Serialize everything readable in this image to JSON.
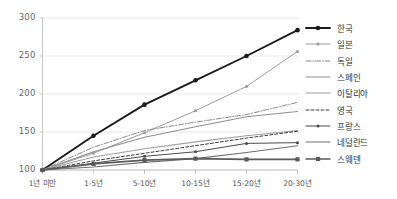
{
  "chart_data": {
    "type": "line",
    "title": "",
    "xlabel": "",
    "ylabel": "",
    "ylim": [
      100,
      300
    ],
    "yticks": [
      100,
      150,
      200,
      250,
      300
    ],
    "grid": true,
    "legend_position": "right",
    "categories": [
      "1년 미만",
      "1-5년",
      "5-10년",
      "10-15년",
      "15-20년",
      "20-30년"
    ],
    "series": [
      {
        "name": "한국",
        "values": [
          100,
          145,
          186,
          218,
          250,
          284
        ],
        "color": "#1a1a1a",
        "style": "solid",
        "width": 1.9,
        "marker": "circle"
      },
      {
        "name": "일본",
        "values": [
          100,
          122,
          149,
          178,
          210,
          256
        ],
        "color": "#9a9a9a",
        "style": "solid",
        "width": 1.0,
        "marker": "dot"
      },
      {
        "name": "독일",
        "values": [
          100,
          130,
          152,
          163,
          173,
          189
        ],
        "color": "#8a8a8a",
        "style": "dashdot",
        "width": 1.0,
        "marker": "none"
      },
      {
        "name": "스페인",
        "values": [
          100,
          124,
          143,
          157,
          170,
          177
        ],
        "color": "#8f8f8f",
        "style": "solid",
        "width": 1.1,
        "marker": "none"
      },
      {
        "name": "이탈리아",
        "values": [
          100,
          117,
          128,
          137,
          145,
          152
        ],
        "color": "#9e9e9e",
        "style": "solid",
        "width": 1.1,
        "marker": "none"
      },
      {
        "name": "영국",
        "values": [
          100,
          112,
          122,
          132,
          142,
          151
        ],
        "color": "#3d3d3d",
        "style": "dashed",
        "width": 1.0,
        "marker": "none"
      },
      {
        "name": "프랑스",
        "values": [
          100,
          109,
          118,
          124,
          135,
          136
        ],
        "color": "#4a4a4a",
        "style": "solid",
        "width": 1.0,
        "marker": "dot"
      },
      {
        "name": "네덜란드",
        "values": [
          100,
          104,
          110,
          115,
          123,
          132
        ],
        "color": "#707070",
        "style": "solid",
        "width": 1.1,
        "marker": "none"
      },
      {
        "name": "스웨덴",
        "values": [
          100,
          108,
          113,
          115,
          114,
          114
        ],
        "color": "#5a5a5a",
        "style": "solid",
        "width": 1.6,
        "marker": "square"
      }
    ]
  },
  "axis": {
    "ytick_labels": [
      "300",
      "250",
      "200",
      "150",
      "100"
    ],
    "xtick_labels": [
      "1년 미만",
      "1-5년",
      "5-10년",
      "10-15년",
      "15-20년",
      "20-30년"
    ]
  },
  "legend": {
    "items": [
      {
        "label": "한국"
      },
      {
        "label": "일본"
      },
      {
        "label": "독일"
      },
      {
        "label": "스페인"
      },
      {
        "label": "이탈리아"
      },
      {
        "label": "영국"
      },
      {
        "label": "프랑스"
      },
      {
        "label": "네덜란드"
      },
      {
        "label": "스웨덴"
      }
    ]
  },
  "colors": {
    "grid": "#e3e3e3",
    "axis": "#bdbdbd",
    "background": "#ffffff"
  }
}
